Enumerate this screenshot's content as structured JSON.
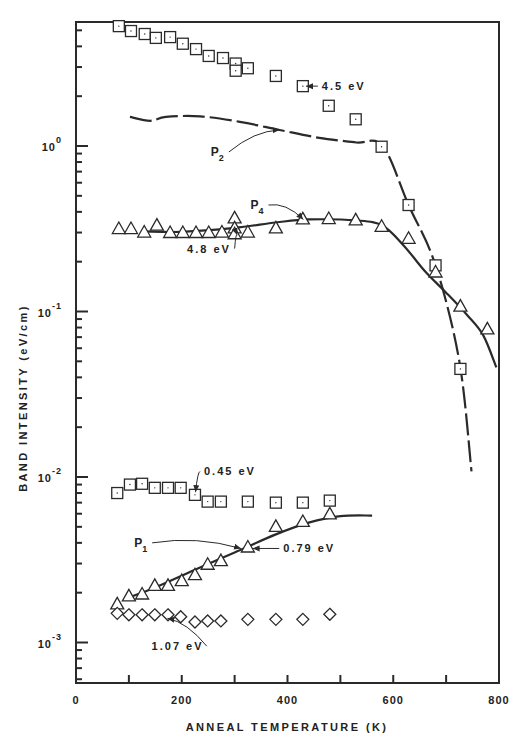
{
  "chart_data": {
    "type": "scatter",
    "title": "",
    "xlabel": "ANNEAL TEMPERATURE (K)",
    "ylabel": "BAND INTENSITY (eV/cm)",
    "xlim": [
      0,
      800
    ],
    "ylim": [
      0.00056,
      5.6
    ],
    "yscale": "log",
    "grid": false,
    "legend": "none (inline annotations)",
    "x_ticks": [
      0,
      100,
      200,
      300,
      400,
      500,
      600,
      700,
      800
    ],
    "x_tick_labels": [
      "0",
      "200",
      "400",
      "600",
      "800"
    ],
    "x_tick_label_values": [
      0,
      200,
      400,
      600,
      800
    ],
    "y_tick_labels": [
      {
        "base": "10",
        "exp": "0",
        "value": 1
      },
      {
        "base": "10",
        "exp": "-1",
        "value": 0.1
      },
      {
        "base": "10",
        "exp": "-2",
        "value": 0.01
      },
      {
        "base": "10",
        "exp": "-3",
        "value": 0.001
      }
    ],
    "series": [
      {
        "name": "4.5 eV",
        "marker": "square",
        "points": [
          [
            81,
            5.3
          ],
          [
            104,
            4.95
          ],
          [
            130,
            4.75
          ],
          [
            151,
            4.5
          ],
          [
            178,
            4.55
          ],
          [
            202,
            4.15
          ],
          [
            227,
            3.85
          ],
          [
            251,
            3.5
          ],
          [
            278,
            3.4
          ],
          [
            302,
            3.15
          ],
          [
            302,
            2.85
          ],
          [
            325,
            2.95
          ],
          [
            378,
            2.65
          ],
          [
            429,
            2.3
          ],
          [
            478,
            1.75
          ],
          [
            529,
            1.45
          ],
          [
            578,
            0.99
          ],
          [
            629,
            0.44
          ],
          [
            680,
            0.19
          ],
          [
            727,
            0.045
          ]
        ]
      },
      {
        "name": "4.8 eV",
        "marker": "triangle",
        "points": [
          [
            81,
            0.315
          ],
          [
            104,
            0.315
          ],
          [
            129,
            0.3
          ],
          [
            153,
            0.33
          ],
          [
            178,
            0.298
          ],
          [
            202,
            0.298
          ],
          [
            227,
            0.298
          ],
          [
            251,
            0.298
          ],
          [
            276,
            0.3
          ],
          [
            300,
            0.365
          ],
          [
            300,
            0.318
          ],
          [
            300,
            0.293
          ],
          [
            325,
            0.3
          ],
          [
            378,
            0.318
          ],
          [
            429,
            0.36
          ],
          [
            478,
            0.362
          ],
          [
            529,
            0.355
          ],
          [
            578,
            0.325
          ],
          [
            629,
            0.275
          ],
          [
            680,
            0.172
          ],
          [
            727,
            0.107
          ],
          [
            778,
            0.078
          ]
        ]
      },
      {
        "name": "0.45 eV",
        "marker": "square",
        "points": [
          [
            78,
            0.008
          ],
          [
            102,
            0.009
          ],
          [
            125,
            0.0091
          ],
          [
            149,
            0.0086
          ],
          [
            174,
            0.0086
          ],
          [
            198,
            0.0086
          ],
          [
            225,
            0.0078
          ],
          [
            249,
            0.0071
          ],
          [
            274,
            0.0071
          ],
          [
            325,
            0.0071
          ],
          [
            378,
            0.007
          ],
          [
            429,
            0.007
          ],
          [
            480,
            0.0072
          ]
        ]
      },
      {
        "name": "0.79 eV",
        "marker": "triangle",
        "points": [
          [
            78,
            0.0017
          ],
          [
            100,
            0.0019
          ],
          [
            125,
            0.00195
          ],
          [
            149,
            0.0022
          ],
          [
            174,
            0.0022
          ],
          [
            200,
            0.00235
          ],
          [
            225,
            0.00255
          ],
          [
            249,
            0.00295
          ],
          [
            274,
            0.0031
          ],
          [
            325,
            0.00375
          ],
          [
            378,
            0.005
          ],
          [
            429,
            0.00535
          ],
          [
            480,
            0.00595
          ]
        ]
      },
      {
        "name": "1.07 eV",
        "marker": "diamond",
        "points": [
          [
            78,
            0.0015
          ],
          [
            100,
            0.00147
          ],
          [
            125,
            0.00147
          ],
          [
            149,
            0.00147
          ],
          [
            174,
            0.00147
          ],
          [
            198,
            0.00143
          ],
          [
            225,
            0.00133
          ],
          [
            249,
            0.00135
          ],
          [
            274,
            0.00135
          ],
          [
            325,
            0.00138
          ],
          [
            378,
            0.00138
          ],
          [
            429,
            0.00138
          ],
          [
            480,
            0.00148
          ]
        ]
      }
    ],
    "curves": [
      {
        "name": "P2",
        "style": "dashed",
        "points": [
          [
            102,
            1.5
          ],
          [
            140,
            1.42
          ],
          [
            170,
            1.5
          ],
          [
            235,
            1.51
          ],
          [
            310,
            1.4
          ],
          [
            385,
            1.25
          ],
          [
            460,
            1.12
          ],
          [
            530,
            1.05
          ],
          [
            580,
            1.0
          ],
          [
            629,
            0.44
          ],
          [
            680,
            0.19
          ],
          [
            725,
            0.05
          ],
          [
            748,
            0.0108
          ]
        ]
      },
      {
        "name": "P4",
        "style": "solid",
        "points": [
          [
            129,
            0.305
          ],
          [
            200,
            0.303
          ],
          [
            300,
            0.32
          ],
          [
            378,
            0.345
          ],
          [
            440,
            0.36
          ],
          [
            530,
            0.355
          ],
          [
            580,
            0.33
          ],
          [
            620,
            0.25
          ],
          [
            660,
            0.175
          ],
          [
            700,
            0.13
          ],
          [
            740,
            0.095
          ],
          [
            770,
            0.072
          ],
          [
            795,
            0.046
          ]
        ]
      },
      {
        "name": "P1",
        "style": "solid",
        "points": [
          [
            100,
            0.00187
          ],
          [
            150,
            0.00215
          ],
          [
            225,
            0.00275
          ],
          [
            300,
            0.0035
          ],
          [
            378,
            0.0045
          ],
          [
            440,
            0.0053
          ],
          [
            500,
            0.0058
          ],
          [
            560,
            0.00585
          ]
        ]
      }
    ],
    "annotations": [
      {
        "id": "lbl-4-5",
        "text": "4.5 eV",
        "x": 465,
        "y": 2.3,
        "arrow_to": [
          435,
          2.3
        ]
      },
      {
        "id": "lbl-p2",
        "text": "P",
        "sub": "2",
        "x": 255,
        "y": 0.92,
        "arrow_to": [
          385,
          1.25
        ]
      },
      {
        "id": "lbl-p4",
        "text": "P",
        "sub": "4",
        "x": 330,
        "y": 0.44,
        "arrow_to": [
          430,
          0.36
        ]
      },
      {
        "id": "lbl-4-8",
        "text": "4.8 eV",
        "x": 210,
        "y": 0.24,
        "arrow_to": [
          305,
          0.29
        ]
      },
      {
        "id": "lbl-0-45",
        "text": "0.45 eV",
        "x": 242,
        "y": 0.0108,
        "arrow_to": [
          226,
          0.0081
        ]
      },
      {
        "id": "lbl-p1",
        "text": "P",
        "sub": "1",
        "x": 110,
        "y": 0.004,
        "arrow_to": [
          312,
          0.0037
        ]
      },
      {
        "id": "lbl-0-79",
        "text": "0.79 eV",
        "x": 392,
        "y": 0.0037,
        "arrow_to": [
          334,
          0.0037
        ]
      },
      {
        "id": "lbl-1-07",
        "text": "1.07 eV",
        "x": 143,
        "y": 0.00095,
        "arrow_to": [
          173,
          0.0014
        ]
      }
    ]
  }
}
